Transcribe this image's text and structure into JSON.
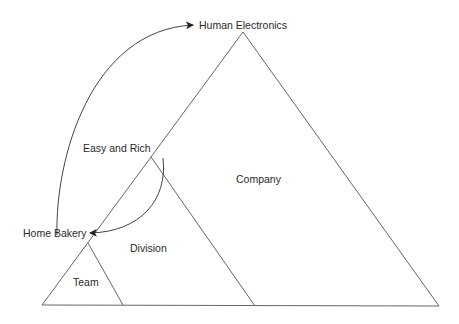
{
  "diagram": {
    "type": "nested-triangles",
    "labels": {
      "top": "Human Electronics",
      "middle": "Easy and Rich",
      "left": "Home Bakery",
      "company": "Company",
      "division": "Division",
      "team": "Team"
    },
    "colors": {
      "line": "#555555",
      "text": "#2a2a2a",
      "background": "#ffffff"
    }
  }
}
